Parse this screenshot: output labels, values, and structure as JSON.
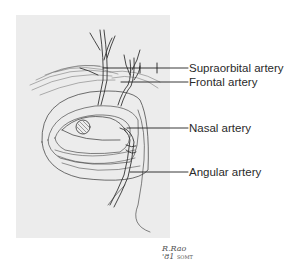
{
  "figure": {
    "panel_color": "#ececec",
    "line_color": "#333333",
    "labels": [
      {
        "id": "supraorbital",
        "text": "Supraorbital artery",
        "y": 62
      },
      {
        "id": "frontal",
        "text": "Frontal artery",
        "y": 77
      },
      {
        "id": "nasal",
        "text": "Nasal artery",
        "y": 122
      },
      {
        "id": "angular",
        "text": "Angular artery",
        "y": 166
      }
    ],
    "signature": {
      "initials": "R.Rao",
      "year": "'81",
      "note": "SOMT"
    }
  }
}
